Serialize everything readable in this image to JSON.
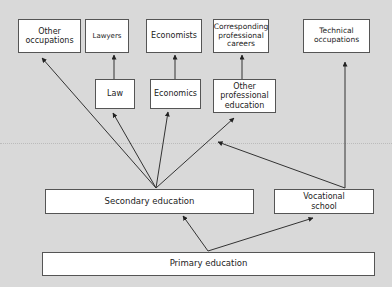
{
  "diagram": {
    "type": "flowchart",
    "nodes": {
      "other_occupations": "Other occupations",
      "lawyers": "Lawyers",
      "economists": "Economists",
      "corresponding_careers": "Corresponding professional careers",
      "technical_occupations": "Technical occupations",
      "law": "Law",
      "economics": "Economics",
      "other_professional_education": "Other professional education",
      "secondary_education": "Secondary education",
      "vocational_school": "Vocational school",
      "primary_education": "Primary education"
    },
    "edges": [
      {
        "from": "Primary education",
        "to": "Secondary education"
      },
      {
        "from": "Primary education",
        "to": "Vocational school"
      },
      {
        "from": "Secondary education",
        "to": "Other occupations"
      },
      {
        "from": "Secondary education",
        "to": "Law"
      },
      {
        "from": "Secondary education",
        "to": "Economics"
      },
      {
        "from": "Secondary education",
        "to": "Other professional education"
      },
      {
        "from": "Vocational school",
        "to": "Secondary education"
      },
      {
        "from": "Vocational school",
        "to": "Technical occupations"
      },
      {
        "from": "Law",
        "to": "Lawyers"
      },
      {
        "from": "Economics",
        "to": "Economists"
      },
      {
        "from": "Other professional education",
        "to": "Corresponding professional careers"
      }
    ],
    "colors": {
      "background": "#d9d9d9",
      "box": "#ffffff",
      "line": "#333333"
    }
  }
}
